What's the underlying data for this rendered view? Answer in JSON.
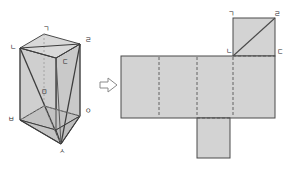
{
  "figure": {
    "colors": {
      "face_fill": "#d3d3d3",
      "face_fill_light": "#dcdcdc",
      "face_fill_dark": "#c6c6c6",
      "edge": "#4a4a4a",
      "hidden_edge": "#6e6e6e",
      "label": "#2b2b2b",
      "arrow_stroke": "#8a8a8a",
      "background": "#ffffff"
    }
  },
  "solid": {
    "name": "triangular-diagonal-prism",
    "vertices": [
      {
        "id": "v1",
        "label": "ㄱ",
        "x": 43,
        "y": 26
      },
      {
        "id": "v2",
        "label": "ㄴ",
        "x": 10,
        "y": 47
      },
      {
        "id": "v3",
        "label": "ㄹ",
        "x": 85,
        "y": 39
      },
      {
        "id": "v4",
        "label": "ㄷ",
        "x": 62,
        "y": 61
      },
      {
        "id": "v5",
        "label": "ㅁ",
        "x": 41,
        "y": 91
      },
      {
        "id": "v6",
        "label": "ㅂ",
        "x": 8,
        "y": 119
      },
      {
        "id": "v7",
        "label": "ㅇ",
        "x": 85,
        "y": 111
      },
      {
        "id": "v8",
        "label": "ㅅ",
        "x": 61,
        "y": 151
      }
    ]
  },
  "arrow": {
    "name": "transform-arrow",
    "direction": "right",
    "glyph": "⇨"
  },
  "net": {
    "name": "prism-net",
    "labels": [
      {
        "id": "n1",
        "label": "ㄱ",
        "x": 230,
        "y": 13
      },
      {
        "id": "n2",
        "label": "ㄹ",
        "x": 275,
        "y": 13
      },
      {
        "id": "n3",
        "label": "ㄴ",
        "x": 228,
        "y": 49
      },
      {
        "id": "n4",
        "label": "ㄷ",
        "x": 275,
        "y": 50
      }
    ],
    "faces": [
      {
        "id": "f-top-square",
        "role": "top-face-with-diagonal"
      },
      {
        "id": "f-row-1",
        "role": "side-face"
      },
      {
        "id": "f-row-2",
        "role": "side-face"
      },
      {
        "id": "f-row-3",
        "role": "side-face"
      },
      {
        "id": "f-row-4",
        "role": "side-face"
      },
      {
        "id": "f-bottom-flap",
        "role": "bottom-face"
      }
    ]
  }
}
